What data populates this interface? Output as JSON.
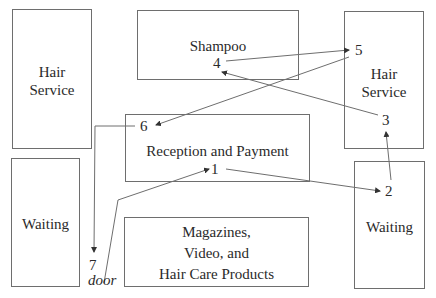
{
  "rooms": [
    {
      "id": "hair-service-left",
      "label_line1": "Hair",
      "label_line2": "Service"
    },
    {
      "id": "shampoo",
      "label": "Shampoo"
    },
    {
      "id": "hair-service-right",
      "label_line1": "Hair",
      "label_line2": "Service"
    },
    {
      "id": "reception",
      "label": "Reception and Payment"
    },
    {
      "id": "waiting-left",
      "label": "Waiting"
    },
    {
      "id": "waiting-right",
      "label": "Waiting"
    },
    {
      "id": "magazines",
      "label_line1": "Magazines,",
      "label_line2": "Video, and",
      "label_line3": "Hair Care Products"
    }
  ],
  "steps": {
    "s1": "1",
    "s2": "2",
    "s3": "3",
    "s4": "4",
    "s5": "5",
    "s6": "6",
    "s7": "7"
  },
  "door_label": "door",
  "colors": {
    "line": "#6e6e6e",
    "text": "#2a2a2a",
    "background": "#ffffff"
  }
}
